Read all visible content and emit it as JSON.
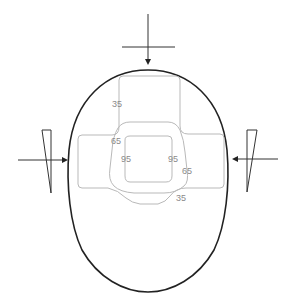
{
  "diagram": {
    "type": "head-contour-force-diagram",
    "colors": {
      "outline": "#222222",
      "contour": "#b9b9b9",
      "label": "#8a8a8a",
      "arrow": "#333333"
    },
    "contour_labels": {
      "outer_top": "35",
      "middle_left": "65",
      "inner_left": "95",
      "inner_right": "95",
      "middle_right": "65",
      "outer_bottom": "35"
    },
    "forces": [
      {
        "name": "top",
        "direction": "down"
      },
      {
        "name": "left",
        "direction": "right"
      },
      {
        "name": "right",
        "direction": "left"
      }
    ]
  }
}
